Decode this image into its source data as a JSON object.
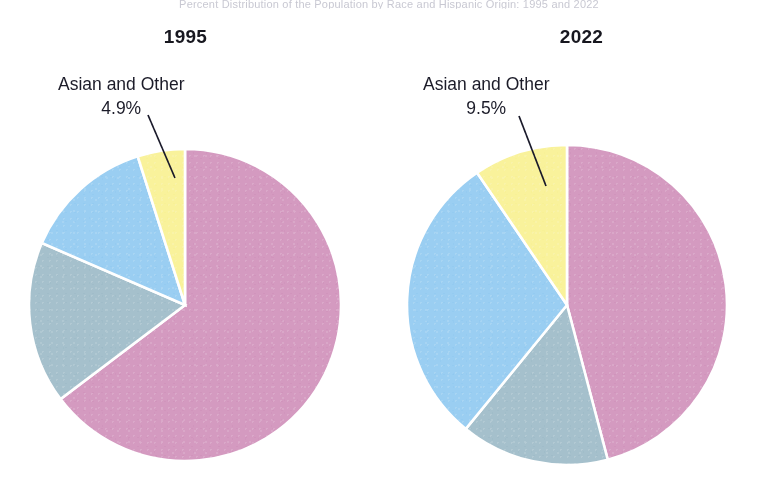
{
  "scan_header": {
    "text": "Percent Distribution of the Population by Race and Hispanic Origin: 1995 and 2022"
  },
  "colors": {
    "white_slice": "#d49ac0",
    "black_slice": "#a5c0cc",
    "hispanic_slice": "#9acef2",
    "asian_slice": "#f9f29b",
    "slice_outline": "#ffffff",
    "leader_line": "#1a1a2a",
    "text": "#16161f",
    "background": "#ffffff"
  },
  "charts": [
    {
      "id": "chart-1995",
      "title": "1995",
      "callout": {
        "label": "Asian and Other",
        "value": "4.9%"
      },
      "slices": [
        {
          "name": "White",
          "label": "White",
          "value": "64.7%"
        },
        {
          "name": "Black",
          "label": "Black",
          "value": "16.8%"
        },
        {
          "name": "Hispanic",
          "label": "Hispanic",
          "value": "13.6%"
        },
        {
          "name": "Asian and Other",
          "label": "Asian and Other",
          "value": "4.9%"
        }
      ]
    },
    {
      "id": "chart-2022",
      "title": "2022",
      "callout": {
        "label": "Asian and Other",
        "value": "9.5%"
      },
      "slices": [
        {
          "name": "White",
          "label": "White",
          "value": "45.9%"
        },
        {
          "name": "Black",
          "label": "Black",
          "value": "15.0%"
        },
        {
          "name": "Hispanic",
          "label": "Hispanic",
          "value": "29.6%"
        },
        {
          "name": "Asian and Other",
          "label": "Asian and Other",
          "value": "9.5%"
        }
      ]
    }
  ],
  "chart_data": [
    {
      "type": "pie",
      "title": "1995",
      "categories": [
        "White",
        "Black",
        "Hispanic",
        "Asian and Other"
      ],
      "values": [
        64.7,
        16.8,
        13.6,
        4.9
      ],
      "value_labels": [
        "64.7%",
        "16.8%",
        "13.6%",
        "4.9%"
      ],
      "unit": "percent",
      "colors": [
        "#d49ac0",
        "#a5c0cc",
        "#9acef2",
        "#f9f29b"
      ],
      "start_angle_deg": 0,
      "direction": "clockwise",
      "legend": "none",
      "grid": false,
      "labels_inside": [
        "White",
        "Black",
        "Hispanic"
      ],
      "labels_outside": [
        "Asian and Other"
      ],
      "xlabel": "",
      "ylabel": ""
    },
    {
      "type": "pie",
      "title": "2022",
      "categories": [
        "White",
        "Black",
        "Hispanic",
        "Asian and Other"
      ],
      "values": [
        45.9,
        15.0,
        29.6,
        9.5
      ],
      "value_labels": [
        "45.9%",
        "15.0%",
        "29.6%",
        "9.5%"
      ],
      "unit": "percent",
      "colors": [
        "#d49ac0",
        "#a5c0cc",
        "#9acef2",
        "#f9f29b"
      ],
      "start_angle_deg": 0,
      "direction": "clockwise",
      "legend": "none",
      "grid": false,
      "labels_inside": [
        "White",
        "Black",
        "Hispanic"
      ],
      "labels_outside": [
        "Asian and Other"
      ],
      "xlabel": "",
      "ylabel": ""
    }
  ]
}
